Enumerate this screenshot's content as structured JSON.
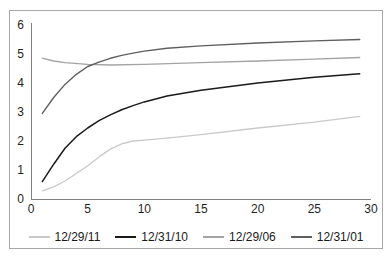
{
  "chart_data": {
    "type": "line",
    "title": "",
    "xlabel": "",
    "ylabel": "",
    "xlim": [
      0,
      30
    ],
    "ylim": [
      0,
      6
    ],
    "x_ticks": [
      0,
      5,
      10,
      15,
      20,
      25,
      30
    ],
    "y_ticks": [
      0,
      1,
      2,
      3,
      4,
      5,
      6
    ],
    "grid": false,
    "legend_position": "bottom",
    "series": [
      {
        "name": "12/29/11",
        "color": "#c9c9c9",
        "width": 1.3,
        "points": [
          [
            1,
            0.28
          ],
          [
            2,
            0.42
          ],
          [
            3,
            0.62
          ],
          [
            4,
            0.88
          ],
          [
            5,
            1.15
          ],
          [
            6,
            1.45
          ],
          [
            7,
            1.72
          ],
          [
            8,
            1.9
          ],
          [
            9,
            2.0
          ],
          [
            10,
            2.03
          ],
          [
            12,
            2.1
          ],
          [
            15,
            2.22
          ],
          [
            20,
            2.45
          ],
          [
            25,
            2.65
          ],
          [
            29,
            2.85
          ]
        ]
      },
      {
        "name": "12/31/10",
        "color": "#1a1a1a",
        "width": 1.5,
        "points": [
          [
            1,
            0.6
          ],
          [
            2,
            1.2
          ],
          [
            3,
            1.75
          ],
          [
            4,
            2.15
          ],
          [
            5,
            2.45
          ],
          [
            6,
            2.7
          ],
          [
            7,
            2.9
          ],
          [
            8,
            3.08
          ],
          [
            9,
            3.22
          ],
          [
            10,
            3.35
          ],
          [
            12,
            3.55
          ],
          [
            15,
            3.75
          ],
          [
            20,
            4.0
          ],
          [
            25,
            4.2
          ],
          [
            29,
            4.32
          ]
        ]
      },
      {
        "name": "12/29/06",
        "color": "#a3a3a3",
        "width": 1.3,
        "points": [
          [
            1,
            4.86
          ],
          [
            2,
            4.76
          ],
          [
            3,
            4.7
          ],
          [
            5,
            4.64
          ],
          [
            7,
            4.62
          ],
          [
            10,
            4.64
          ],
          [
            15,
            4.7
          ],
          [
            20,
            4.76
          ],
          [
            25,
            4.82
          ],
          [
            29,
            4.88
          ]
        ]
      },
      {
        "name": "12/31/01",
        "color": "#5f5f5f",
        "width": 1.4,
        "points": [
          [
            1,
            2.95
          ],
          [
            2,
            3.5
          ],
          [
            3,
            3.95
          ],
          [
            4,
            4.3
          ],
          [
            5,
            4.57
          ],
          [
            6,
            4.72
          ],
          [
            7,
            4.85
          ],
          [
            8,
            4.95
          ],
          [
            9,
            5.03
          ],
          [
            10,
            5.1
          ],
          [
            12,
            5.2
          ],
          [
            15,
            5.28
          ],
          [
            20,
            5.38
          ],
          [
            25,
            5.45
          ],
          [
            29,
            5.5
          ]
        ]
      }
    ]
  },
  "colors": {
    "axis": "#808080",
    "frame_border": "#a6a6a6",
    "tick_text": "#1f1f1f",
    "background": "#ffffff"
  }
}
